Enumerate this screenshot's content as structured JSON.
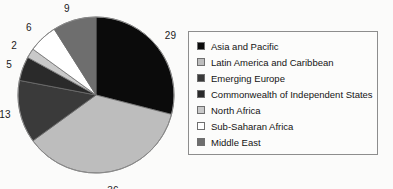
{
  "chart_data": {
    "type": "pie",
    "title": "",
    "labels": [
      "Asia and Pacific",
      "Latin America and Caribbean",
      "Emerging Europe",
      "Commonwealth of Independent States",
      "North Africa",
      "Sub-Saharan Africa",
      "Middle East"
    ],
    "values": [
      29,
      36,
      13,
      5,
      2,
      6,
      9
    ],
    "value_labels": [
      "29",
      "36",
      "13",
      "5",
      "2",
      "6",
      "9"
    ],
    "colors": [
      "#0b0b0b",
      "#bdbdbd",
      "#3a3a3a",
      "#2a2a2a",
      "#c9c9c9",
      "#ffffff",
      "#6e6e6e"
    ],
    "total": 100,
    "start_angle_deg": 0,
    "direction": "clockwise",
    "legend_position": "right",
    "grid": false
  },
  "legend": {
    "items": [
      {
        "label": "Asia and Pacific",
        "color": "#0b0b0b"
      },
      {
        "label": "Latin America and Caribbean",
        "color": "#bdbdbd"
      },
      {
        "label": "Emerging Europe",
        "color": "#3a3a3a"
      },
      {
        "label": "Commonwealth of Independent States",
        "color": "#2a2a2a"
      },
      {
        "label": "North Africa",
        "color": "#c9c9c9"
      },
      {
        "label": "Sub-Saharan Africa",
        "color": "#ffffff"
      },
      {
        "label": "Middle East",
        "color": "#6e6e6e"
      }
    ]
  }
}
